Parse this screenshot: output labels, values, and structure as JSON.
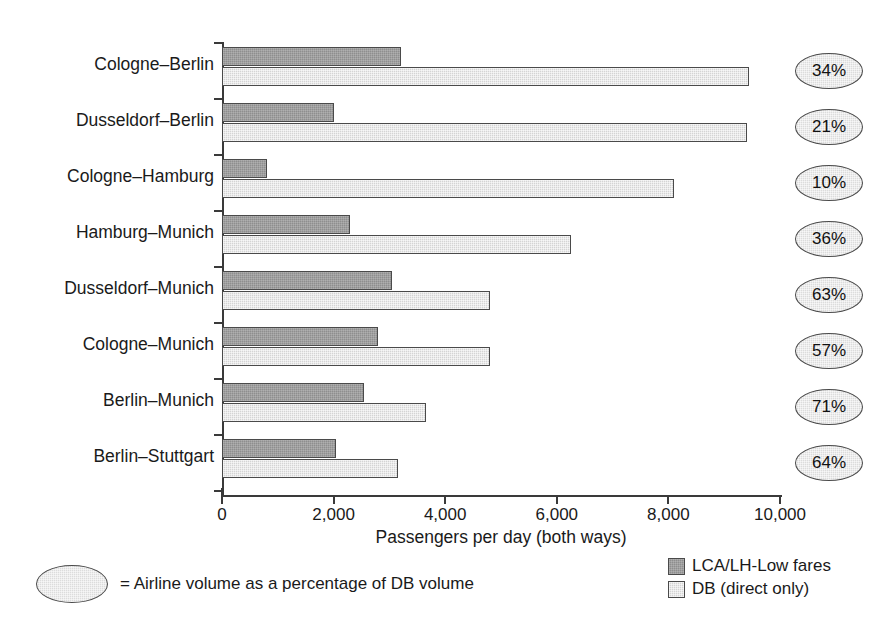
{
  "chart_data": {
    "type": "bar",
    "orientation": "horizontal",
    "title": "",
    "xlabel": "Passengers per day (both ways)",
    "ylabel": "",
    "xlim": [
      0,
      10000
    ],
    "xticks": [
      0,
      2000,
      4000,
      6000,
      8000,
      10000
    ],
    "xtick_labels": [
      "0",
      "2,000",
      "4,000",
      "6,000",
      "8,000",
      "10,000"
    ],
    "grid": false,
    "legend_position": "bottom-right",
    "categories": [
      "Cologne–Berlin",
      "Dusseldorf–Berlin",
      "Cologne–Hamburg",
      "Hamburg–Munich",
      "Dusseldorf–Munich",
      "Cologne–Munich",
      "Berlin–Munich",
      "Berlin–Stuttgart"
    ],
    "series": [
      {
        "name": "LCA/LH-Low fares",
        "color": "#8e8e8e",
        "values": [
          3200,
          2000,
          800,
          2300,
          3050,
          2800,
          2550,
          2050
        ]
      },
      {
        "name": "DB (direct only)",
        "color": "#d4d4d4",
        "values": [
          9450,
          9400,
          8100,
          6250,
          4800,
          4800,
          3650,
          3150
        ]
      }
    ],
    "annotations": {
      "label": "Airline volume as a percentage of DB volume",
      "values": [
        "34%",
        "21%",
        "10%",
        "36%",
        "63%",
        "57%",
        "71%",
        "64%"
      ]
    }
  },
  "footnote": {
    "text": "= Airline volume as a percentage of DB volume"
  },
  "legend": {
    "items": [
      {
        "label": "LCA/LH-Low fares"
      },
      {
        "label": "DB (direct only)"
      }
    ]
  },
  "axis": {
    "x_title": "Passengers per day (both ways)"
  }
}
